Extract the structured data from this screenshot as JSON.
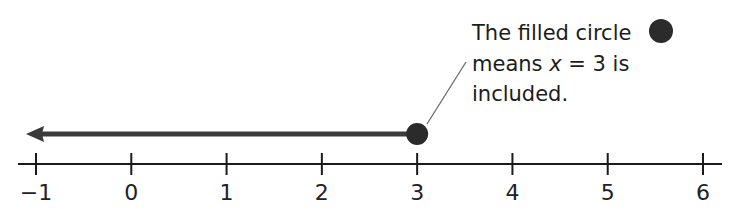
{
  "diagram": {
    "type": "number-line-inequality",
    "axis": {
      "min": -1,
      "max": 6,
      "ticks": [
        -1,
        0,
        1,
        2,
        3,
        4,
        5,
        6
      ],
      "tick_labels": [
        "−1",
        "0",
        "1",
        "2",
        "3",
        "4",
        "5",
        "6"
      ]
    },
    "ray": {
      "from": 3,
      "direction": "left",
      "endpoint": "filled-circle"
    },
    "annotation": {
      "lines": [
        {
          "text": "The filled circle"
        },
        {
          "prefix": "means ",
          "variable": "x",
          "suffix": " = 3 is"
        },
        {
          "text": "included."
        }
      ],
      "legend_symbol": "filled-circle"
    },
    "colors": {
      "axis": "#1a1a1a",
      "ray": "#3a3a3a",
      "point": "#2b2b2b",
      "leader_line": "#6a6a6a",
      "text": "#1c1c1c"
    }
  }
}
